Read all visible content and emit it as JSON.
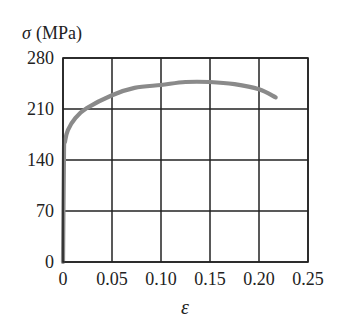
{
  "chart_data": {
    "type": "line",
    "title": "",
    "ylabel_symbol": "σ",
    "ylabel_unit": "(MPa)",
    "ylabel": "σ (MPa)",
    "xlabel": "ε",
    "xlim": [
      0,
      0.25
    ],
    "ylim": [
      0,
      280
    ],
    "xticks": [
      0,
      0.05,
      0.1,
      0.15,
      0.2,
      0.25
    ],
    "xtick_labels": [
      "0",
      "0.05",
      "0.10",
      "0.15",
      "0.20",
      "0.25"
    ],
    "yticks": [
      0,
      70,
      140,
      210,
      280
    ],
    "ytick_labels": [
      "0",
      "70",
      "140",
      "210",
      "280"
    ],
    "grid": true,
    "legend": null,
    "series": [
      {
        "name": "stress-strain curve",
        "color": "#8a8a8a",
        "x": [
          0,
          0.001,
          0.002,
          0.005,
          0.013,
          0.024,
          0.05,
          0.073,
          0.1,
          0.125,
          0.15,
          0.175,
          0.2,
          0.217
        ],
        "y": [
          0,
          154,
          165,
          181,
          198,
          211,
          229,
          239,
          243,
          247,
          247,
          244,
          237,
          226
        ]
      }
    ]
  },
  "colors": {
    "grid": "#222222",
    "curve": "#8a8a8a",
    "text": "#222222"
  }
}
